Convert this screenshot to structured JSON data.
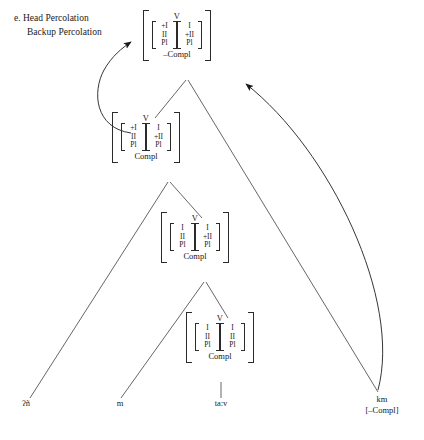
{
  "caption": {
    "line1": "e. Head Percolation",
    "line2": "Backup Percolation"
  },
  "labels": {
    "head": "V",
    "compl": "Compl",
    "neg_compl": "–Compl",
    "plus_i": "+I",
    "i": "I",
    "ii": "II",
    "plus_ii": "+II",
    "pl": "Pl"
  },
  "nodes": [
    {
      "id": "node-1",
      "head": "V",
      "left_col": [
        "+I",
        "II",
        "Pl"
      ],
      "right_col": [
        "I",
        "+II",
        "Pl"
      ],
      "foot": "–Compl"
    },
    {
      "id": "node-2",
      "head": "V",
      "left_col": [
        "+I",
        "II",
        "Pl"
      ],
      "right_col": [
        "I",
        "+II",
        "Pl"
      ],
      "foot": "Compl"
    },
    {
      "id": "node-3",
      "head": "V",
      "left_col": [
        "I",
        "II",
        "Pl"
      ],
      "right_col": [
        "I",
        "+II",
        "Pl"
      ],
      "foot": "Compl"
    },
    {
      "id": "node-4",
      "head": "V",
      "left_col": [
        "I",
        "II",
        "Pl"
      ],
      "right_col": [
        "I",
        "II",
        "Pl"
      ],
      "foot": "Compl"
    }
  ],
  "leaves": [
    {
      "id": "leaf-1",
      "text": "ʔñ",
      "sub": ""
    },
    {
      "id": "leaf-2",
      "text": "m",
      "sub": ""
    },
    {
      "id": "leaf-3",
      "text": "taːv",
      "sub": ""
    },
    {
      "id": "leaf-4",
      "text": "km",
      "sub": "[–Compl]"
    }
  ],
  "colors": {
    "ink": "#2b2b2b",
    "background": "#ffffff"
  }
}
